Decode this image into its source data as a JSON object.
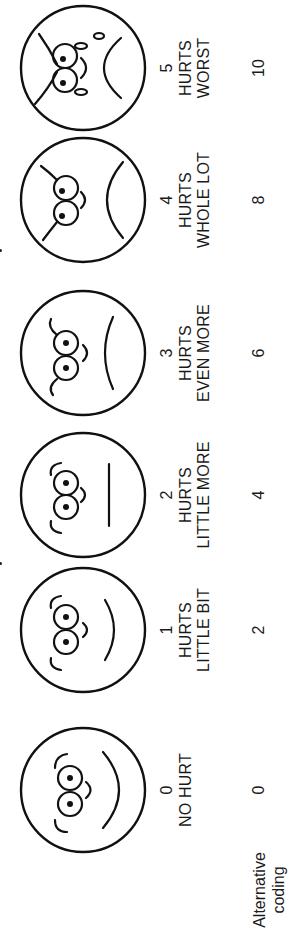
{
  "scale": {
    "title": "Wong-Baker FACES Pain Rating Scale",
    "alternative_coding_label": "Alternative coding",
    "faces": [
      {
        "score": "0",
        "line1": "NO HURT",
        "line2": "",
        "alt_code": "0",
        "expression": "happy"
      },
      {
        "score": "1",
        "line1": "HURTS",
        "line2": "LITTLE BIT",
        "alt_code": "2",
        "expression": "slight-smile"
      },
      {
        "score": "2",
        "line1": "HURTS",
        "line2": "LITTLE MORE",
        "alt_code": "4",
        "expression": "neutral"
      },
      {
        "score": "3",
        "line1": "HURTS",
        "line2": "EVEN MORE",
        "alt_code": "6",
        "expression": "slight-frown"
      },
      {
        "score": "4",
        "line1": "HURTS",
        "line2": "WHOLE LOT",
        "alt_code": "8",
        "expression": "frown"
      },
      {
        "score": "5",
        "line1": "HURTS",
        "line2": "WORST",
        "alt_code": "10",
        "expression": "crying"
      }
    ]
  }
}
